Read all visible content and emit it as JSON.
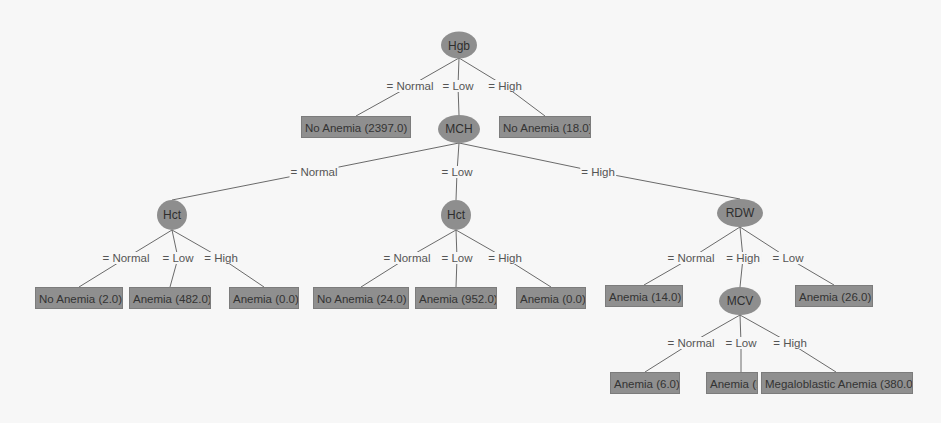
{
  "colors": {
    "background": "#f7f7f7",
    "node_fill": "#8e8e8e",
    "leaf_fill": "#8f8f8f",
    "edge": "#6a6a6a",
    "label_text": "#555555"
  },
  "nodes": [
    {
      "id": "hgb",
      "label": "Hgb",
      "x": 459,
      "y": 45,
      "w": 36,
      "h": 27
    },
    {
      "id": "mch",
      "label": "MCH",
      "x": 459,
      "y": 129,
      "w": 42,
      "h": 28
    },
    {
      "id": "hct1",
      "label": "Hct",
      "x": 172,
      "y": 215,
      "w": 30,
      "h": 30
    },
    {
      "id": "hct2",
      "label": "Hct",
      "x": 456,
      "y": 215,
      "w": 30,
      "h": 30
    },
    {
      "id": "rdw",
      "label": "RDW",
      "x": 740,
      "y": 213,
      "w": 46,
      "h": 28
    },
    {
      "id": "mcv",
      "label": "MCV",
      "x": 740,
      "y": 301,
      "w": 42,
      "h": 28
    }
  ],
  "leaves": [
    {
      "id": "l1",
      "label": "No Anemia (2397.0)",
      "x": 356,
      "y": 127,
      "w": 110
    },
    {
      "id": "l2",
      "label": "No Anemia (18.0)",
      "x": 545,
      "y": 127,
      "w": 92
    },
    {
      "id": "l3",
      "label": "No Anemia (2.0)",
      "x": 79,
      "y": 298,
      "w": 88
    },
    {
      "id": "l4",
      "label": "Anemia (482.0)",
      "x": 170,
      "y": 298,
      "w": 82
    },
    {
      "id": "l5",
      "label": "Anemia (0.0)",
      "x": 264,
      "y": 298,
      "w": 70
    },
    {
      "id": "l6",
      "label": "No Anemia (24.0)",
      "x": 361,
      "y": 298,
      "w": 96
    },
    {
      "id": "l7",
      "label": "Anemia (952.0)",
      "x": 456,
      "y": 298,
      "w": 82
    },
    {
      "id": "l8",
      "label": "Anemia (0.0)",
      "x": 551,
      "y": 298,
      "w": 70
    },
    {
      "id": "l9",
      "label": "Anemia (14.0)",
      "x": 644,
      "y": 296,
      "w": 78
    },
    {
      "id": "l10",
      "label": "Anemia (26.0)",
      "x": 834,
      "y": 296,
      "w": 78
    },
    {
      "id": "l11",
      "label": "Anemia (6.0)",
      "x": 645,
      "y": 383,
      "w": 70
    },
    {
      "id": "l12",
      "label": "Anemia (!",
      "x": 732,
      "y": 383,
      "w": 52
    },
    {
      "id": "l13",
      "label": "Megaloblastic Anemia (380.0)",
      "x": 837,
      "y": 383,
      "w": 152
    }
  ],
  "edges": [
    {
      "from": [
        459,
        58
      ],
      "mid": [
        410,
        86
      ],
      "to": [
        356,
        116
      ],
      "label": "= Normal"
    },
    {
      "from": [
        459,
        58
      ],
      "mid": [
        458,
        86
      ],
      "to": [
        459,
        115
      ],
      "label": "= Low"
    },
    {
      "from": [
        459,
        58
      ],
      "mid": [
        505,
        86
      ],
      "to": [
        545,
        116
      ],
      "label": "= High"
    },
    {
      "from": [
        459,
        143
      ],
      "mid": [
        314,
        172
      ],
      "to": [
        172,
        200
      ],
      "label": "= Normal"
    },
    {
      "from": [
        459,
        143
      ],
      "mid": [
        457,
        172
      ],
      "to": [
        456,
        200
      ],
      "label": "= Low"
    },
    {
      "from": [
        459,
        143
      ],
      "mid": [
        598,
        172
      ],
      "to": [
        740,
        199
      ],
      "label": "= High"
    },
    {
      "from": [
        172,
        230
      ],
      "mid": [
        126,
        258
      ],
      "to": [
        79,
        287
      ],
      "label": "= Normal"
    },
    {
      "from": [
        172,
        230
      ],
      "mid": [
        178,
        258
      ],
      "to": [
        170,
        287
      ],
      "label": "= Low"
    },
    {
      "from": [
        172,
        230
      ],
      "mid": [
        221,
        258
      ],
      "to": [
        264,
        287
      ],
      "label": "= High"
    },
    {
      "from": [
        456,
        230
      ],
      "mid": [
        407,
        258
      ],
      "to": [
        361,
        287
      ],
      "label": "= Normal"
    },
    {
      "from": [
        456,
        230
      ],
      "mid": [
        457,
        258
      ],
      "to": [
        456,
        287
      ],
      "label": "= Low"
    },
    {
      "from": [
        456,
        230
      ],
      "mid": [
        505,
        258
      ],
      "to": [
        551,
        287
      ],
      "label": "= High"
    },
    {
      "from": [
        740,
        227
      ],
      "mid": [
        691,
        258
      ],
      "to": [
        644,
        285
      ],
      "label": "= Normal"
    },
    {
      "from": [
        740,
        227
      ],
      "mid": [
        743,
        258
      ],
      "to": [
        740,
        287
      ],
      "label": "= High"
    },
    {
      "from": [
        740,
        227
      ],
      "mid": [
        788,
        258
      ],
      "to": [
        834,
        285
      ],
      "label": "= Low"
    },
    {
      "from": [
        740,
        315
      ],
      "mid": [
        691,
        343
      ],
      "to": [
        645,
        372
      ],
      "label": "= Normal"
    },
    {
      "from": [
        740,
        315
      ],
      "mid": [
        741,
        343
      ],
      "to": [
        741,
        372
      ],
      "label": "= Low"
    },
    {
      "from": [
        740,
        315
      ],
      "mid": [
        790,
        343
      ],
      "to": [
        836,
        372
      ],
      "label": "= High"
    }
  ]
}
